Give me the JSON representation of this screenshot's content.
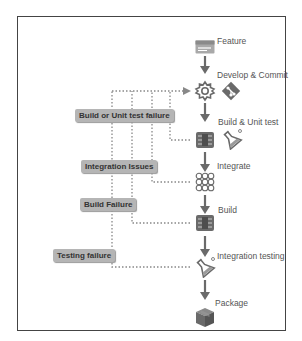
{
  "pipeline": {
    "steps": [
      {
        "label": "Feature",
        "icon": "feature-card-icon"
      },
      {
        "label": "Develop & Commit",
        "icon": "gear-icon",
        "secondary_icon": "git-icon"
      },
      {
        "label": "Build & Unit test",
        "icon": "build-server-icon",
        "secondary_icon": "test-flask-icon"
      },
      {
        "label": "Integrate",
        "icon": "integration-grid-icon"
      },
      {
        "label": "Build",
        "icon": "build-server-icon"
      },
      {
        "label": "Integration testing",
        "icon": "test-flask-icon"
      },
      {
        "label": "Package",
        "icon": "package-box-icon"
      }
    ]
  },
  "feedback_loops": [
    {
      "label": "Build or Unit test failure",
      "from": "Build & Unit test",
      "to": "Develop & Commit"
    },
    {
      "label": "Integration Issues",
      "from": "Integrate",
      "to": "Develop & Commit"
    },
    {
      "label": "Build Failure",
      "from": "Build",
      "to": "Develop & Commit"
    },
    {
      "label": "Testing failure",
      "from": "Integration testing",
      "to": "Develop & Commit"
    }
  ],
  "colors": {
    "icon": "#6a6a6a",
    "arrow": "#6a6a6a",
    "dotted_line": "#888888",
    "label_bg": "#b5b5b5",
    "frame": "#444444"
  }
}
